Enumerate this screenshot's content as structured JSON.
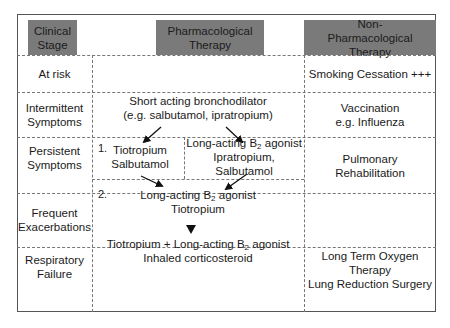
{
  "headers": {
    "stage": "Clinical Stage",
    "pharm": "Pharmacological Therapy",
    "nonpharm": "Non-Pharmacological Therapy"
  },
  "rows": [
    {
      "stage_l1": "At risk",
      "stage_l2": "",
      "pharm": [],
      "nonpharm": [
        "Smoking Cessation +++"
      ]
    },
    {
      "stage_l1": "Intermittent",
      "stage_l2": "Symptoms",
      "pharm": [
        "Short acting bronchodilator",
        "(e.g. salbutamol, ipratropium)"
      ],
      "nonpharm": [
        "Vaccination",
        "e.g. Influenza"
      ]
    },
    {
      "stage_l1": "Persistent",
      "stage_l2": "Symptoms",
      "nonpharm": [
        "Pulmonary",
        "Rehabilitation"
      ]
    },
    {
      "stage_l1": "Frequent",
      "stage_l2": "Exacerbations",
      "nonpharm": []
    },
    {
      "stage_l1": "Respiratory",
      "stage_l2": "Failure",
      "pharm": [],
      "nonpharm": [
        "Long Term Oxygen Therapy",
        "Lung Reduction Surgery"
      ]
    }
  ],
  "persistent": {
    "option1_num": "1.",
    "option1_l1": "Tiotropium",
    "option1_l2": "Salbutamol",
    "option1b_l1_pre": "Long-acting B",
    "option1b_l1_sub": "2",
    "option1b_l1_post": " agonist",
    "option1b_l2": "Ipratropium, Salbutamol",
    "option2_num": "2.",
    "option2_l1_pre": "Long-acting B",
    "option2_l1_sub": "2",
    "option2_l1_post": " agonist",
    "option2_l2": "Tiotropium"
  },
  "frequent": {
    "l1_pre": "Tiotropium + Long-acting B",
    "l1_sub": "2",
    "l1_post": " agonist",
    "l2": "Inhaled corticosteroid"
  },
  "colors": {
    "header_bg": "#7a7a7a",
    "line": "#777777",
    "text": "#1a1a1a"
  }
}
